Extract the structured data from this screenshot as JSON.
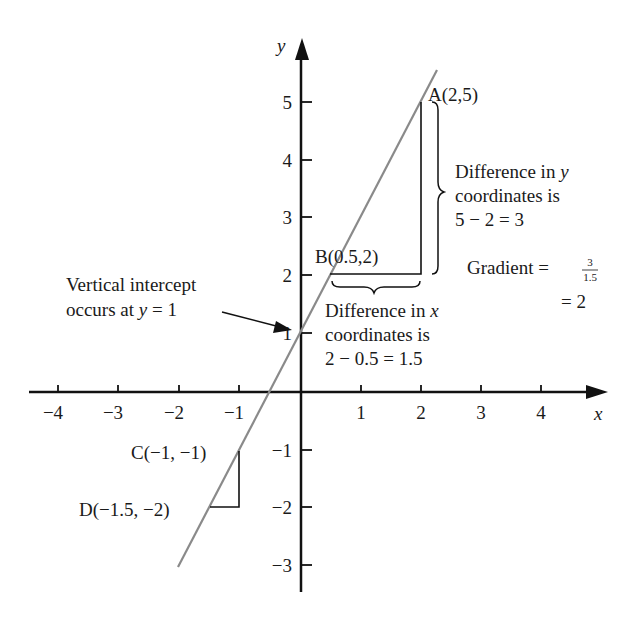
{
  "chart_data": {
    "type": "line",
    "title": "",
    "xlabel": "x",
    "ylabel": "y",
    "xlim": [
      -4.4,
      4.9
    ],
    "ylim": [
      -3.5,
      5.8
    ],
    "grid": false,
    "x_ticks": [
      "−4",
      "−3",
      "−2",
      "−1",
      "1",
      "2",
      "3",
      "4"
    ],
    "y_ticks": [
      "5",
      "4",
      "3",
      "2",
      "1",
      "−1",
      "−2",
      "−3"
    ],
    "series": [
      {
        "name": "y = 2x + 1",
        "x": [
          -2,
          2.25
        ],
        "y": [
          -3,
          5.5
        ]
      }
    ],
    "points": [
      {
        "label": "A(2,5)",
        "x": 2,
        "y": 5
      },
      {
        "label": "B(0.5,2)",
        "x": 0.5,
        "y": 2
      },
      {
        "label": "C(−1, −1)",
        "x": -1,
        "y": -1
      },
      {
        "label": "D(−1.5, −2)",
        "x": -1.5,
        "y": -2
      }
    ],
    "annotations": [
      "Vertical intercept occurs at y = 1",
      "Difference in y coordinates is 5 − 2 = 3",
      "Difference in x coordinates is 2 − 0.5 = 1.5",
      "Gradient = 3/1.5 = 2"
    ]
  },
  "axes": {
    "x_label": "x",
    "y_label": "y",
    "x_ticks": [
      {
        "label": "−4",
        "px": 58
      },
      {
        "label": "−3",
        "px": 118
      },
      {
        "label": "−2",
        "px": 179
      },
      {
        "label": "−1",
        "px": 239
      },
      {
        "label": "1",
        "px": 361
      },
      {
        "label": "2",
        "px": 421
      },
      {
        "label": "3",
        "px": 481
      },
      {
        "label": "4",
        "px": 541
      }
    ],
    "y_ticks": [
      {
        "label": "5",
        "py": 102
      },
      {
        "label": "4",
        "py": 160
      },
      {
        "label": "3",
        "py": 217
      },
      {
        "label": "2",
        "py": 275
      },
      {
        "label": "1",
        "py": 333
      },
      {
        "label": "−1",
        "py": 450
      },
      {
        "label": "−2",
        "py": 507
      },
      {
        "label": "−3",
        "py": 565
      }
    ]
  },
  "labels": {
    "point_a": "A(2,5)",
    "point_b": "B(0.5,2)",
    "point_c": "C(−1, −1)",
    "point_d": "D(−1.5, −2)",
    "intercept_line1": "Vertical intercept",
    "intercept_line2_prefix": "occurs at ",
    "intercept_line2_var": "y",
    "intercept_line2_suffix": " = 1",
    "dy_line1_prefix": "Difference in ",
    "dy_line1_var": "y",
    "dy_line2": "coordinates is",
    "dy_line3": "5 − 2 = 3",
    "dx_line1_prefix": "Difference in ",
    "dx_line1_var": "x",
    "dx_line2": "coordinates is",
    "dx_line3": "2 − 0.5 = 1.5",
    "gradient_label": "Gradient = ",
    "gradient_num": "3",
    "gradient_den": "1.5",
    "gradient_result": "= 2"
  },
  "colors": {
    "axis": "#111111",
    "line": "#8a8a8a",
    "text": "#1a1a1a",
    "background": "#ffffff"
  }
}
